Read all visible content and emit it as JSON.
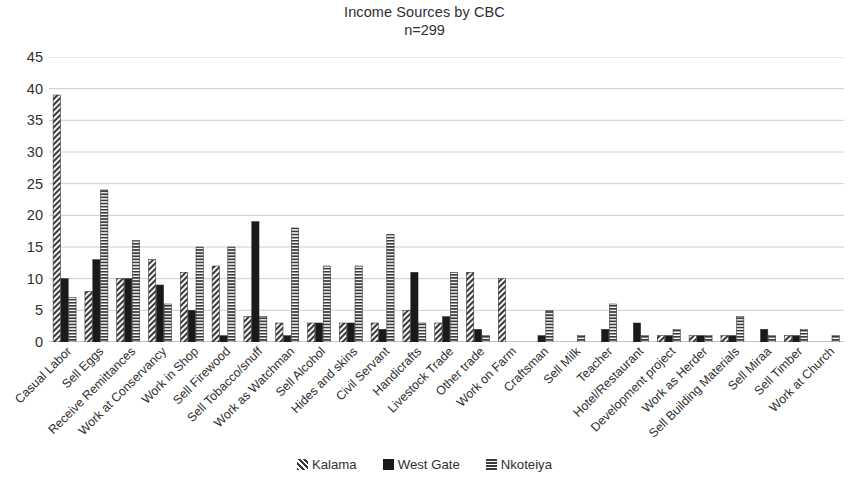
{
  "chart_data": {
    "type": "bar",
    "title": "Income Sources by CBC",
    "subtitle": "n=299",
    "xlabel": "",
    "ylabel": "",
    "ylim": [
      0,
      45
    ],
    "ytick_step": 5,
    "yticks": [
      45,
      40,
      35,
      30,
      25,
      20,
      15,
      10,
      5,
      0
    ],
    "grid": true,
    "grid_axis": "y",
    "legend_position": "bottom",
    "categories": [
      "Casual Labor",
      "Sell Eggs",
      "Receive Remittances",
      "Work at Conservancy",
      "Work in Shop",
      "Sell Firewood",
      "Sell Tobacco/snuff",
      "Work as Watchman",
      "Sell Alcohol",
      "Hides and skins",
      "Civil Servant",
      "Handicrafts",
      "Livestock Trade",
      "Other trade",
      "Work on Farm",
      "Craftsman",
      "Sell Milk",
      "Teacher",
      "Hotel/Restaurant",
      "Development project",
      "Work as Herder",
      "Sell Building Materials",
      "Sell Miraa",
      "Sell Timber",
      "Work at Church"
    ],
    "series": [
      {
        "name": "Kalama",
        "pattern": "diagonal-hatch",
        "color": "#3a3a3a",
        "values": [
          39,
          8,
          10,
          13,
          11,
          12,
          4,
          3,
          3,
          3,
          3,
          5,
          3,
          11,
          10,
          0,
          0,
          0,
          0,
          1,
          1,
          1,
          0,
          1,
          0
        ]
      },
      {
        "name": "West Gate",
        "pattern": "solid",
        "color": "#1a1a1a",
        "values": [
          10,
          13,
          10,
          9,
          5,
          1,
          19,
          1,
          3,
          3,
          2,
          11,
          4,
          2,
          0,
          1,
          0,
          2,
          3,
          1,
          1,
          1,
          2,
          1,
          0
        ]
      },
      {
        "name": "Nkoteiya",
        "pattern": "horizontal-lines",
        "color": "#3a3a3a",
        "values": [
          7,
          24,
          16,
          6,
          15,
          15,
          4,
          18,
          12,
          12,
          17,
          3,
          11,
          1,
          0,
          5,
          1,
          6,
          1,
          2,
          1,
          4,
          1,
          2,
          1
        ]
      }
    ]
  },
  "legend": {
    "items": [
      {
        "label": "Kalama",
        "pattern": "diagonal-hatch"
      },
      {
        "label": "West Gate",
        "pattern": "solid"
      },
      {
        "label": "Nkoteiya",
        "pattern": "horizontal-lines"
      }
    ]
  }
}
